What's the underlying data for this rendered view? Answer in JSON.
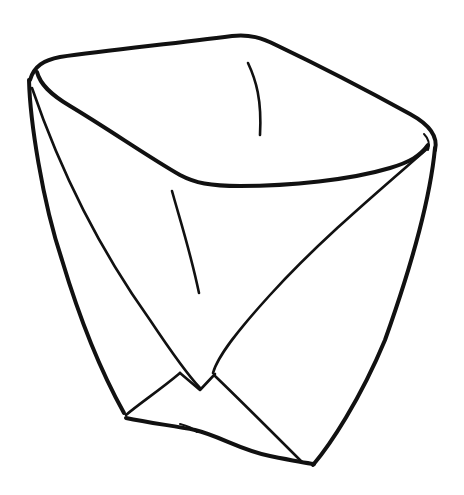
{
  "illustration": {
    "subject": "folded-paper-cup-line-drawing",
    "colors": {
      "background": "#ffffff",
      "ink": "#111111"
    }
  }
}
